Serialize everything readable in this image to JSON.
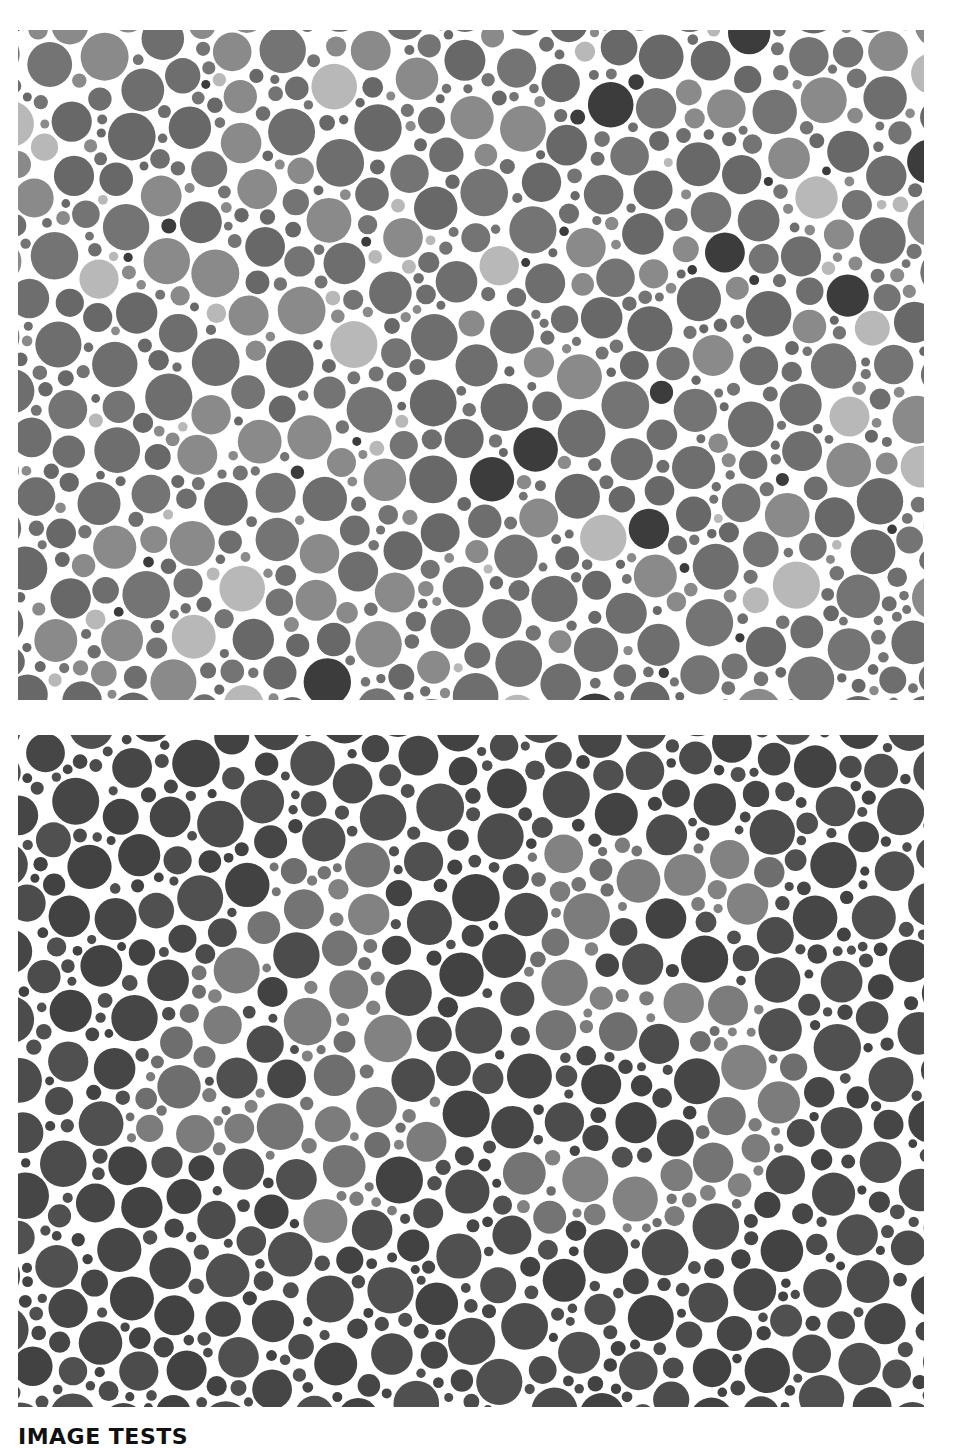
{
  "plates": [
    {
      "id": "top",
      "label": "Color vision test plate 1 (grayscale)",
      "hidden_number": null,
      "colors": {
        "background": "#ffffff",
        "figure": [
          "#b4b4b4",
          "#a6a6a6",
          "#9a9a9a"
        ],
        "ground": [
          "#6e6e6e",
          "#747474",
          "#686868",
          "#8a8a8a",
          "#3c3c3c"
        ]
      },
      "seed": 1234
    },
    {
      "id": "bottom",
      "label": "Color vision test plate 2 (grayscale)",
      "hidden_number": "45",
      "colors": {
        "background": "#ffffff",
        "figure": [
          "#7c7c7c",
          "#747474",
          "#828282",
          "#6e6e6e"
        ],
        "ground": [
          "#464646",
          "#4c4c4c",
          "#505050",
          "#424242"
        ]
      },
      "seed": 98765
    }
  ],
  "section_heading": "IMAGE TESTS"
}
